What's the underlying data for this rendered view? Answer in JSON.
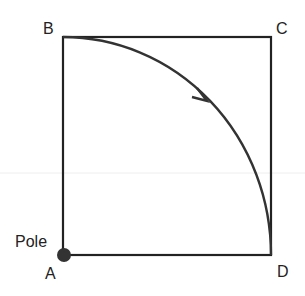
{
  "diagram": {
    "type": "geometry",
    "labels": {
      "A": "A",
      "B": "B",
      "C": "C",
      "D": "D",
      "pole": "Pole"
    },
    "colors": {
      "stroke": "#222222",
      "arc": "#333333",
      "pole_dot": "#333333",
      "background": "#ffffff"
    },
    "arc": {
      "from": "B",
      "to": "D",
      "center": "A",
      "direction": "clockwise"
    }
  }
}
